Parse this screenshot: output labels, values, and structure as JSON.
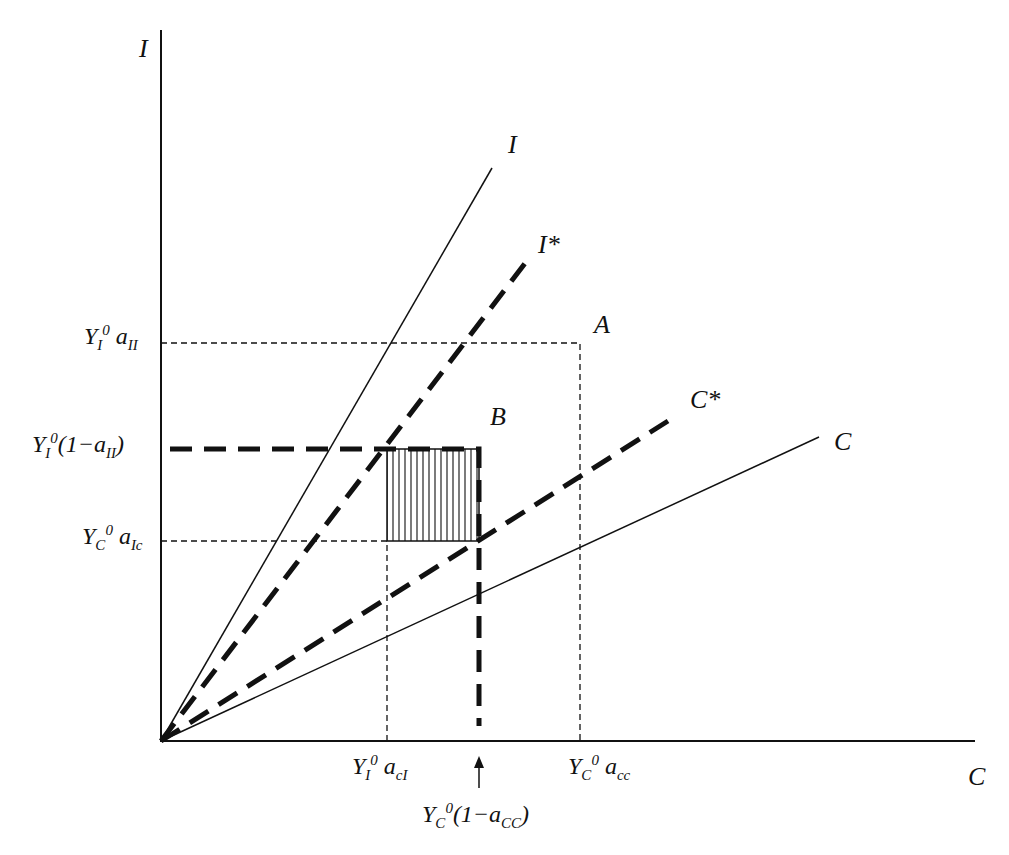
{
  "axes": {
    "y_label": "I",
    "x_label": "C"
  },
  "lines": {
    "I": "I",
    "I_star": "I*",
    "C": "C",
    "C_star": "C*"
  },
  "points": {
    "A": "A",
    "B": "B"
  },
  "y_ticks": {
    "t1": {
      "base": "Y",
      "sub": "I",
      "sup": "0",
      "rest": "a",
      "rest_sub": "II"
    },
    "t2": {
      "base": "Y",
      "sub": "I",
      "sup": "0",
      "rest": "(1−a",
      "rest_sub": "II",
      "close": ")"
    },
    "t3": {
      "base": "Y",
      "sub": "C",
      "sup": "0",
      "rest": "a",
      "rest_sub": "Ic"
    }
  },
  "x_ticks": {
    "t1": {
      "base": "Y",
      "sub": "I",
      "sup": "0",
      "rest": "a",
      "rest_sub": "cI"
    },
    "t2": {
      "base": "Y",
      "sub": "C",
      "sup": "0",
      "rest": "a",
      "rest_sub": "cc"
    },
    "t3": {
      "base": "Y",
      "sub": "C",
      "sup": "0",
      "rest": "(1−a",
      "rest_sub": "CC",
      "close": ")"
    }
  }
}
